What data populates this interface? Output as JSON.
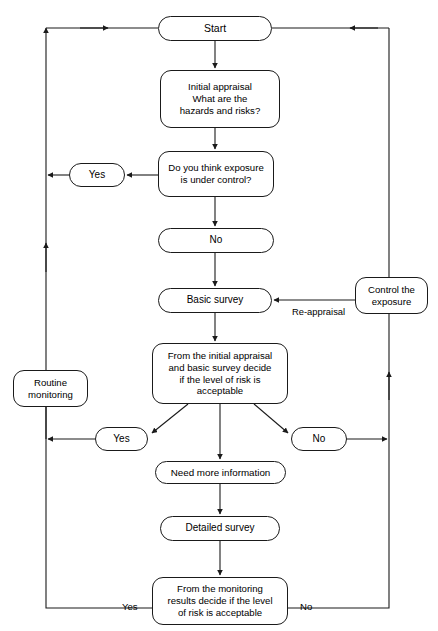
{
  "diagram": {
    "stroke_color": "#1a1a1a",
    "background_color": "#ffffff",
    "text_color": "#000000",
    "width": 438,
    "height": 631,
    "nodes": [
      {
        "id": "start",
        "label": "Start",
        "shape": "rounded-pill",
        "x": 158,
        "y": 16,
        "w": 114,
        "h": 25,
        "font_size": 10.5
      },
      {
        "id": "initial-appraisal",
        "label": "Initial appraisal\nWhat are the\nhazards and risks?",
        "shape": "rounded-rect",
        "x": 160,
        "y": 70,
        "w": 120,
        "h": 58,
        "font_size": 9.6
      },
      {
        "id": "exposure-question",
        "label": "Do you think exposure\nis under control?",
        "shape": "rounded-rect",
        "x": 158,
        "y": 151,
        "w": 116,
        "h": 46,
        "font_size": 9.6
      },
      {
        "id": "yes-exposure",
        "label": "Yes",
        "shape": "rounded-pill",
        "x": 69,
        "y": 163,
        "w": 56,
        "h": 24,
        "font_size": 10
      },
      {
        "id": "no-exposure",
        "label": "No",
        "shape": "rounded-pill",
        "x": 158,
        "y": 228,
        "w": 116,
        "h": 25,
        "font_size": 10
      },
      {
        "id": "basic-survey",
        "label": "Basic survey",
        "shape": "rounded-pill",
        "x": 158,
        "y": 288,
        "w": 114,
        "h": 25,
        "font_size": 10
      },
      {
        "id": "control-exposure",
        "label": "Control the\nexposure",
        "shape": "rounded-rect",
        "x": 355,
        "y": 277,
        "w": 73,
        "h": 37,
        "font_size": 9.6
      },
      {
        "id": "risk-decision",
        "label": "From the initial appraisal\nand basic survey decide\nif the level of risk is\nacceptable",
        "shape": "rounded-rect",
        "x": 152,
        "y": 343,
        "w": 136,
        "h": 61,
        "font_size": 9.6
      },
      {
        "id": "routine-monitoring",
        "label": "Routine\nmonitoring",
        "shape": "rounded-rect",
        "x": 13,
        "y": 370,
        "w": 75,
        "h": 37,
        "font_size": 9.6
      },
      {
        "id": "yes-risk",
        "label": "Yes",
        "shape": "rounded-pill",
        "x": 95,
        "y": 427,
        "w": 53,
        "h": 24,
        "font_size": 10
      },
      {
        "id": "no-risk",
        "label": "No",
        "shape": "rounded-pill",
        "x": 291,
        "y": 427,
        "w": 56,
        "h": 24,
        "font_size": 10
      },
      {
        "id": "need-more-info",
        "label": "Need more information",
        "shape": "rounded-pill",
        "x": 155,
        "y": 461,
        "w": 131,
        "h": 23,
        "font_size": 9.8
      },
      {
        "id": "detailed-survey",
        "label": "Detailed survey",
        "shape": "rounded-pill",
        "x": 160,
        "y": 516,
        "w": 120,
        "h": 25,
        "font_size": 10
      },
      {
        "id": "monitoring-decision",
        "label": "From the monitoring\nresults decide if the level\nof risk is acceptable",
        "shape": "rounded-rect",
        "x": 152,
        "y": 577,
        "w": 136,
        "h": 48,
        "font_size": 9.6
      }
    ],
    "edge_labels": [
      {
        "id": "re-appraisal",
        "label": "Re-appraisal",
        "x": 292,
        "y": 306,
        "font_size": 9.4
      },
      {
        "id": "yes-bottom",
        "label": "Yes",
        "x": 122,
        "y": 601,
        "font_size": 9.6
      },
      {
        "id": "no-bottom",
        "label": "No",
        "x": 300,
        "y": 601,
        "font_size": 9.6
      }
    ],
    "connectors": [
      {
        "id": "start-to-initial",
        "from": "start",
        "to": "initial-appraisal",
        "type": "vertical-arrow"
      },
      {
        "id": "initial-to-question",
        "from": "initial-appraisal",
        "to": "exposure-question",
        "type": "vertical-arrow"
      },
      {
        "id": "question-to-yes",
        "from": "exposure-question",
        "to": "yes-exposure",
        "type": "horizontal-arrow-left"
      },
      {
        "id": "yes-to-left-rail",
        "from": "yes-exposure",
        "to": "left-rail",
        "type": "horizontal-arrow-left"
      },
      {
        "id": "question-to-no",
        "from": "exposure-question",
        "to": "no-exposure",
        "type": "vertical-arrow"
      },
      {
        "id": "no-to-basic-survey",
        "from": "no-exposure",
        "to": "basic-survey",
        "type": "vertical-arrow"
      },
      {
        "id": "control-to-basic-survey",
        "from": "control-exposure",
        "to": "basic-survey",
        "type": "horizontal-arrow-left",
        "label": "Re-appraisal"
      },
      {
        "id": "basic-survey-to-decision",
        "from": "basic-survey",
        "to": "risk-decision",
        "type": "vertical-arrow"
      },
      {
        "id": "decision-to-yes",
        "from": "risk-decision",
        "to": "yes-risk",
        "type": "diagonal-arrow-left"
      },
      {
        "id": "decision-to-need-info",
        "from": "risk-decision",
        "to": "need-more-info",
        "type": "vertical-arrow"
      },
      {
        "id": "decision-to-no",
        "from": "risk-decision",
        "to": "no-risk",
        "type": "diagonal-arrow-right"
      },
      {
        "id": "yes-risk-to-left-rail",
        "from": "yes-risk",
        "to": "left-rail",
        "type": "horizontal-arrow-left"
      },
      {
        "id": "no-risk-to-right-rail",
        "from": "no-risk",
        "to": "right-rail",
        "type": "horizontal-arrow-right"
      },
      {
        "id": "need-info-to-detailed",
        "from": "need-more-info",
        "to": "detailed-survey",
        "type": "vertical-arrow"
      },
      {
        "id": "detailed-to-monitoring",
        "from": "detailed-survey",
        "to": "monitoring-decision",
        "type": "vertical-arrow"
      },
      {
        "id": "monitoring-yes-to-left-rail",
        "from": "monitoring-decision",
        "to": "left-rail",
        "type": "elbow",
        "label": "Yes"
      },
      {
        "id": "monitoring-no-to-right-rail",
        "from": "monitoring-decision",
        "to": "right-rail",
        "type": "elbow",
        "label": "No"
      },
      {
        "id": "left-rail-to-start",
        "from": "left-rail",
        "to": "start",
        "type": "horizontal-arrow-right"
      },
      {
        "id": "right-rail-to-start",
        "from": "right-rail",
        "to": "start",
        "type": "horizontal-arrow-left"
      },
      {
        "id": "left-rail-through-routine",
        "from": "left-rail",
        "to": "routine-monitoring",
        "type": "vertical-pass-through"
      },
      {
        "id": "right-rail-to-control",
        "from": "right-rail",
        "to": "control-exposure",
        "type": "vertical-pass-through"
      }
    ]
  }
}
